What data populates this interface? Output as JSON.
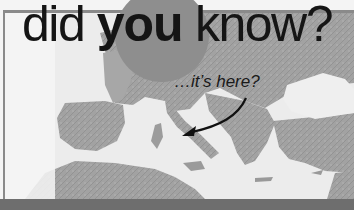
{
  "banner": {
    "headline": {
      "word1": "did",
      "word2": "you",
      "word3": "know?"
    },
    "callout": "…it’s here?",
    "arrow_target": "Italy",
    "map_region": "Europe and the Mediterranean",
    "colors": {
      "background": "#f4f4f4",
      "land": "#a3a3a3",
      "sea": "#eeeeee",
      "circle": "#8e8e8e",
      "text": "#151515",
      "border": "#8a8a8a",
      "bottom_band": "#6e6e6e"
    }
  },
  "icons": {
    "arrow": "curved-arrow-icon",
    "circle": "highlight-circle"
  }
}
